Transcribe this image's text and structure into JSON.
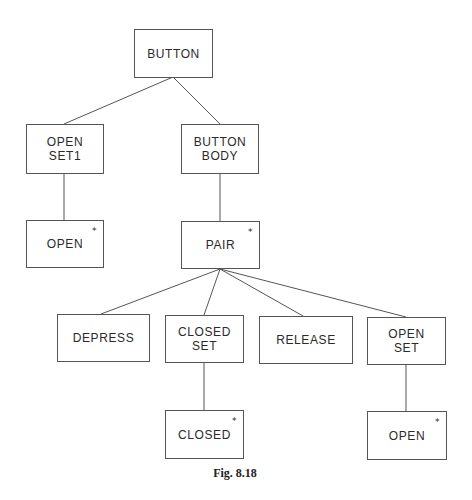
{
  "figure": {
    "caption": "Fig. 8.18",
    "marker_symbol": "*"
  },
  "nodes": {
    "button": {
      "label": "BUTTON",
      "starred": false
    },
    "open_set1": {
      "label": "OPEN\nSET1",
      "starred": false
    },
    "button_body": {
      "label": "BUTTON\nBODY",
      "starred": false
    },
    "open_leaf_1": {
      "label": "OPEN",
      "starred": true
    },
    "pair": {
      "label": "PAIR",
      "starred": true
    },
    "depress": {
      "label": "DEPRESS",
      "starred": false
    },
    "closed_set": {
      "label": "CLOSED\nSET",
      "starred": false
    },
    "release": {
      "label": "RELEASE",
      "starred": false
    },
    "open_set": {
      "label": "OPEN\nSET",
      "starred": false
    },
    "closed_leaf": {
      "label": "CLOSED",
      "starred": true
    },
    "open_leaf_2": {
      "label": "OPEN",
      "starred": true
    }
  },
  "edges": [
    [
      "button",
      "open_set1"
    ],
    [
      "button",
      "button_body"
    ],
    [
      "open_set1",
      "open_leaf_1"
    ],
    [
      "button_body",
      "pair"
    ],
    [
      "pair",
      "depress"
    ],
    [
      "pair",
      "closed_set"
    ],
    [
      "pair",
      "release"
    ],
    [
      "pair",
      "open_set"
    ],
    [
      "closed_set",
      "closed_leaf"
    ],
    [
      "open_set",
      "open_leaf_2"
    ]
  ]
}
